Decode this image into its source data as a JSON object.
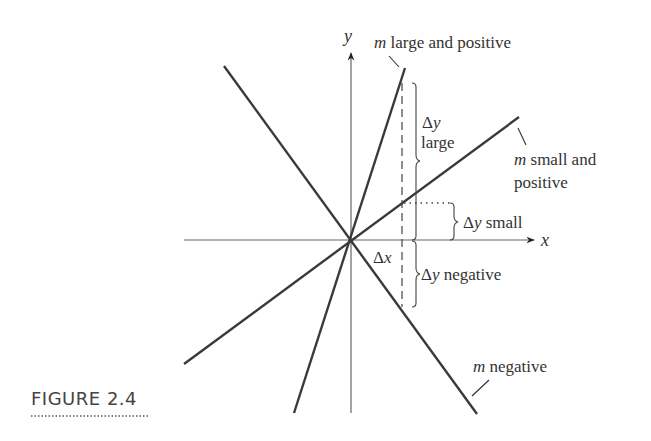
{
  "figure": {
    "caption": "FIGURE 2.4",
    "axes": {
      "x_label": "x",
      "y_label": "y"
    },
    "lines": [
      {
        "id": "m-large-positive",
        "label_italic": "m",
        "label_rest": " large and positive",
        "color": "#3a3a3a"
      },
      {
        "id": "m-small-positive",
        "label_italic": "m",
        "label_rest_line1": " small and",
        "label_line2": "positive",
        "color": "#3a3a3a"
      },
      {
        "id": "m-negative",
        "label_italic": "m",
        "label_rest": " negative",
        "color": "#3a3a3a"
      }
    ],
    "annotations": {
      "dy_large_delta": "Δ",
      "dy_large_var": "y",
      "dy_large_word": "large",
      "dy_small_delta": "Δ",
      "dy_small_var": "y",
      "dy_small_word": " small",
      "dy_negative_delta": "Δ",
      "dy_negative_var": "y",
      "dy_negative_word": " negative",
      "dx_delta": "Δ",
      "dx_var": "x"
    }
  }
}
